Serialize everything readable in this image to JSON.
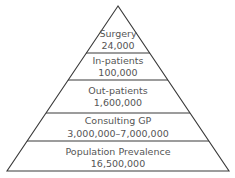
{
  "diagram": {
    "type": "pyramid",
    "levels": [
      {
        "name": "Surgery",
        "value": "24,000"
      },
      {
        "name": "In-patients",
        "value": "100,000"
      },
      {
        "name": "Out-patients",
        "value": "1,600,000"
      },
      {
        "name": "Consulting GP",
        "value": "3,000,000–7,000,000"
      },
      {
        "name": "Population Prevalence",
        "value": "16,500,000"
      }
    ]
  },
  "colors": {
    "line": "#3a3a3a",
    "text": "#555555",
    "background": "#ffffff"
  }
}
